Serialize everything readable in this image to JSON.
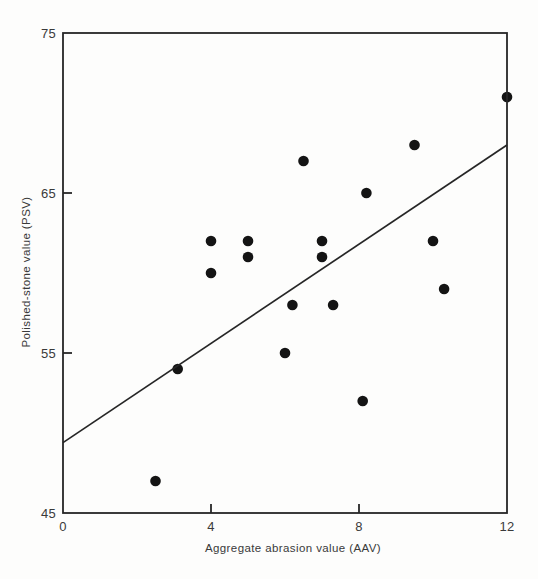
{
  "figure": {
    "background": "#fdfdfc",
    "axis_color": "#262626",
    "text_color": "#3a3a3a",
    "point_color": "#141414",
    "trendline_color": "#262626"
  },
  "chart_data": {
    "type": "scatter",
    "title": "",
    "xlabel": "Aggregate abrasion value (AAV)",
    "ylabel": "Polished-stone value (PSV)",
    "xlim": [
      0,
      12
    ],
    "ylim": [
      45,
      75
    ],
    "x_ticks": [
      0,
      4,
      8,
      12
    ],
    "y_ticks": [
      45,
      55,
      65,
      75
    ],
    "grid": false,
    "legend": "none",
    "points": [
      {
        "x": 2.5,
        "y": 47
      },
      {
        "x": 3.1,
        "y": 54
      },
      {
        "x": 4,
        "y": 60
      },
      {
        "x": 4,
        "y": 62
      },
      {
        "x": 5,
        "y": 61
      },
      {
        "x": 5,
        "y": 62
      },
      {
        "x": 6,
        "y": 55
      },
      {
        "x": 6.2,
        "y": 58
      },
      {
        "x": 6.5,
        "y": 67
      },
      {
        "x": 7,
        "y": 61
      },
      {
        "x": 7,
        "y": 62
      },
      {
        "x": 7.3,
        "y": 58
      },
      {
        "x": 8.1,
        "y": 52
      },
      {
        "x": 8.2,
        "y": 65
      },
      {
        "x": 9.5,
        "y": 68
      },
      {
        "x": 10,
        "y": 62
      },
      {
        "x": 10.3,
        "y": 59
      },
      {
        "x": 12,
        "y": 71
      }
    ],
    "trend_line": {
      "x_start": 0,
      "y_start": 49.4,
      "x_end": 12,
      "y_end": 68
    }
  }
}
